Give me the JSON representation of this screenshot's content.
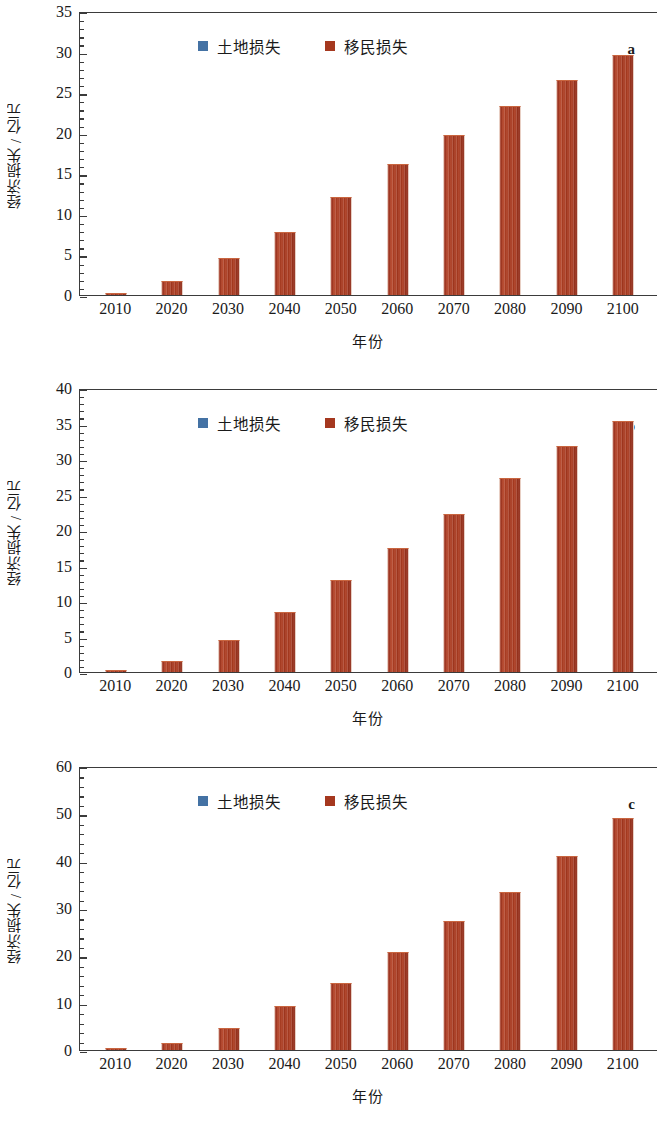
{
  "figure": {
    "axis_titles": {
      "y": "经济损失 / 亿元",
      "x": "年份"
    },
    "legend": {
      "land_label": "土地损失",
      "migration_label": "移民损失"
    },
    "colors": {
      "land": "#4472a4",
      "migration": "#a5381f",
      "axis": "#3b3b3b"
    },
    "panel_letters": {
      "a": "a",
      "b": "b",
      "c": "c"
    }
  },
  "chart_data": [
    {
      "type": "bar",
      "panel": "a",
      "title": "",
      "xlabel": "年份",
      "ylabel": "经济损失 / 亿元",
      "categories": [
        "2010",
        "2020",
        "2030",
        "2040",
        "2050",
        "2060",
        "2070",
        "2080",
        "2090",
        "2100"
      ],
      "ylim": [
        0,
        35
      ],
      "ytick_labels": [
        "0",
        "5",
        "10",
        "15",
        "20",
        "25",
        "30",
        "35"
      ],
      "ytick_values": [
        0,
        5,
        10,
        15,
        20,
        25,
        30,
        35
      ],
      "minor_tick_step": 1,
      "grid": false,
      "legend_position": "top-left",
      "series": [
        {
          "name": "土地损失",
          "values": [
            0,
            0,
            0,
            0,
            0,
            0,
            0,
            0,
            0,
            0
          ]
        },
        {
          "name": "移民损失",
          "values": [
            0.3,
            1.7,
            4.6,
            7.8,
            12.1,
            16.2,
            19.7,
            23.3,
            26.5,
            29.6
          ]
        }
      ]
    },
    {
      "type": "bar",
      "panel": "b",
      "title": "",
      "xlabel": "年份",
      "ylabel": "经济损失 / 亿元",
      "categories": [
        "2010",
        "2020",
        "2030",
        "2040",
        "2050",
        "2060",
        "2070",
        "2080",
        "2090",
        "2100"
      ],
      "ylim": [
        0,
        40
      ],
      "ytick_labels": [
        "0",
        "5",
        "10",
        "15",
        "20",
        "25",
        "30",
        "35",
        "40"
      ],
      "ytick_values": [
        0,
        5,
        10,
        15,
        20,
        25,
        30,
        35,
        40
      ],
      "minor_tick_step": 1,
      "grid": false,
      "legend_position": "top-left",
      "series": [
        {
          "name": "土地损失",
          "values": [
            0,
            0,
            0,
            0,
            0,
            0,
            0,
            0,
            0,
            0
          ]
        },
        {
          "name": "移民损失",
          "values": [
            0.3,
            1.5,
            4.5,
            8.5,
            13.0,
            17.5,
            22.2,
            27.3,
            31.9,
            35.3
          ]
        }
      ]
    },
    {
      "type": "bar",
      "panel": "c",
      "title": "",
      "xlabel": "年份",
      "ylabel": "经济损失 / 亿元",
      "categories": [
        "2010",
        "2020",
        "2030",
        "2040",
        "2050",
        "2060",
        "2070",
        "2080",
        "2090",
        "2100"
      ],
      "ylim": [
        0,
        60
      ],
      "ytick_labels": [
        "0",
        "10",
        "20",
        "30",
        "40",
        "50",
        "60"
      ],
      "ytick_values": [
        0,
        10,
        20,
        30,
        40,
        50,
        60
      ],
      "minor_tick_step": 2,
      "grid": false,
      "legend_position": "top-left",
      "series": [
        {
          "name": "土地损失",
          "values": [
            0,
            0,
            0,
            0,
            0,
            0,
            0,
            0,
            0,
            0
          ]
        },
        {
          "name": "移民损失",
          "values": [
            0.35,
            1.5,
            4.6,
            9.2,
            14.2,
            20.7,
            27.2,
            33.4,
            41.0,
            49.0
          ]
        }
      ]
    }
  ]
}
